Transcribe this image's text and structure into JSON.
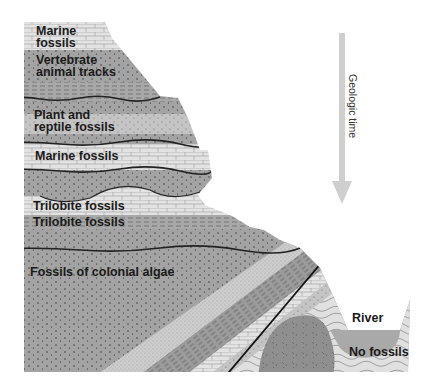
{
  "diagram": {
    "colors": {
      "background": "#ffffff",
      "light_limestone": "#e2e2e2",
      "medium_gray": "#b7b7b7",
      "dark_gray": "#9a9a9a",
      "darkest_gray": "#8c8c8c",
      "line": "#262626",
      "arrow": "#cfcfcf",
      "river": "#a9a9a9"
    },
    "layer_labels": [
      {
        "id": "marine-top-1",
        "text": "Marine"
      },
      {
        "id": "marine-top-2",
        "text": "fossils"
      },
      {
        "id": "vertebrate-1",
        "text": "Vertebrate"
      },
      {
        "id": "vertebrate-2",
        "text": "animal tracks"
      },
      {
        "id": "plant-1",
        "text": "Plant and"
      },
      {
        "id": "plant-2",
        "text": "reptile fossils"
      },
      {
        "id": "marine-mid",
        "text": "Marine fossils"
      },
      {
        "id": "trilobite-1",
        "text": "Trilobite fossils"
      },
      {
        "id": "trilobite-2",
        "text": "Trilobite fossils"
      },
      {
        "id": "algae",
        "text": "Fossils of colonial algae"
      },
      {
        "id": "river",
        "text": "River"
      },
      {
        "id": "no-fossils",
        "text": "No fossils"
      }
    ],
    "time_arrow": {
      "label": "Geologic time",
      "direction": "down"
    }
  }
}
